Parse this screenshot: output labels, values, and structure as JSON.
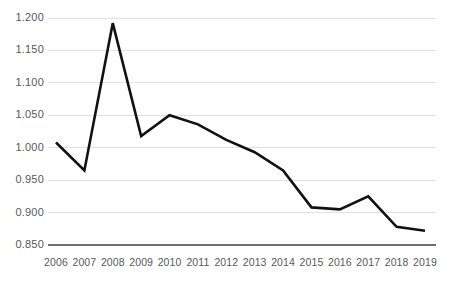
{
  "chart_data": {
    "type": "line",
    "title": "",
    "subtitle": "",
    "xlabel": "",
    "ylabel": "",
    "categories": [
      "2006",
      "2007",
      "2008",
      "2009",
      "2010",
      "2011",
      "2012",
      "2013",
      "2014",
      "2015",
      "2016",
      "2017",
      "2018",
      "2019"
    ],
    "values": [
      1.008,
      0.965,
      1.192,
      1.018,
      1.05,
      1.036,
      1.012,
      0.993,
      0.965,
      0.908,
      0.905,
      0.925,
      0.878,
      0.872
    ],
    "series": [
      {
        "name": "",
        "values": [
          1.008,
          0.965,
          1.192,
          1.018,
          1.05,
          1.036,
          1.012,
          0.993,
          0.965,
          0.908,
          0.905,
          0.925,
          0.878,
          0.872
        ]
      }
    ],
    "ylim": [
      0.85,
      1.2
    ],
    "ytick_values": [
      1.2,
      1.15,
      1.1,
      1.05,
      1.0,
      0.95,
      0.9,
      0.85
    ],
    "ytick_labels": [
      "1.200",
      "1.150",
      "1.100",
      "1.050",
      "1.000",
      "0.950",
      "0.900",
      "0.850"
    ],
    "xtick_labels": [
      "2006",
      "2007",
      "2008",
      "2009",
      "2010",
      "2011",
      "2012",
      "2013",
      "2014",
      "2015",
      "2016",
      "2017",
      "2018",
      "2019"
    ],
    "grid": true,
    "legend": false,
    "legend_position": "none",
    "annotations": [],
    "colors": {
      "line": "#111111",
      "gridline": "#d9d9d9",
      "axis": "#6f6f6f",
      "tick_text": "#58595b",
      "background": "#ffffff"
    }
  }
}
